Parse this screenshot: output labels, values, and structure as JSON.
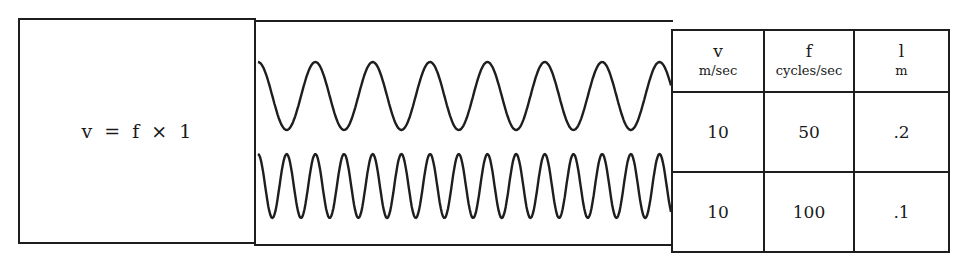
{
  "formula": {
    "text": "v = f × 1"
  },
  "waves": {
    "stroke_color": "#1e1e1e",
    "top": {
      "label": "wave-50hz",
      "cycles": 7.2,
      "amplitude_px": 34,
      "center_y": 96
    },
    "bottom": {
      "label": "wave-100hz",
      "cycles": 14.4,
      "amplitude_px": 32,
      "center_y": 186
    }
  },
  "table": {
    "headers": [
      {
        "symbol": "v",
        "unit": "m/sec"
      },
      {
        "symbol": "f",
        "unit": "cycles/sec"
      },
      {
        "symbol": "l",
        "unit": "m"
      }
    ],
    "rows": [
      [
        "10",
        "50",
        ".2"
      ],
      [
        "10",
        "100",
        ".1"
      ]
    ]
  }
}
